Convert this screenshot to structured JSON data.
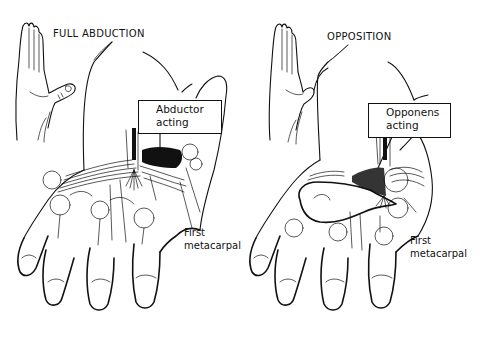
{
  "figure": {
    "panels": [
      {
        "id": "left",
        "title": "FULL ABDUCTION",
        "callout": {
          "line1": "Abductor",
          "line2": "acting"
        },
        "note": {
          "line1": "First",
          "line2": "metacarpal"
        }
      },
      {
        "id": "right",
        "title": "OPPOSITION",
        "callout": {
          "line1": "Opponens",
          "line2": "acting"
        },
        "note": {
          "line1": "First",
          "line2": "metacarpal"
        }
      }
    ],
    "colors": {
      "ink": "#111111",
      "paper": "#ffffff"
    }
  }
}
